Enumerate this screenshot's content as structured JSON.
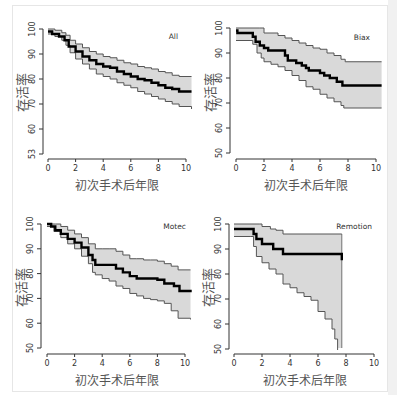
{
  "chart_data": [
    {
      "type": "line",
      "title": "All",
      "xlabel": "初次手术后年限",
      "ylabel": "存活率",
      "xlim": [
        0,
        10
      ],
      "ylim": [
        50,
        100
      ],
      "xticks": [
        0,
        2,
        4,
        6,
        8,
        10
      ],
      "yticks": [
        50,
        60,
        70,
        80,
        90,
        100
      ],
      "ytick_labels": [
        "53",
        "60",
        "70",
        "80",
        "90",
        "100"
      ],
      "grid": false,
      "series": [
        {
          "name": "survival",
          "x": [
            0,
            0.3,
            0.8,
            1.2,
            1.5,
            2,
            2.5,
            3,
            3.5,
            4,
            4.5,
            5,
            5.5,
            6,
            6.5,
            7,
            7.5,
            8,
            8.5,
            9,
            9.5,
            10.4
          ],
          "y": [
            99,
            98,
            97,
            95.5,
            93,
            91,
            89,
            87.5,
            86,
            85,
            84.5,
            83,
            82,
            81,
            80,
            79.5,
            78.5,
            77.5,
            76.5,
            76,
            75,
            75
          ]
        },
        {
          "name": "upper_ci",
          "x": [
            0,
            0.5,
            1,
            1.3,
            1.6,
            2,
            2.5,
            3,
            3.5,
            4,
            4.5,
            5,
            5.5,
            6,
            6.5,
            7,
            7.5,
            8,
            8.5,
            9,
            9.5,
            10.4
          ],
          "y": [
            100,
            99.5,
            98.5,
            97.5,
            95.5,
            94,
            92.5,
            91,
            90,
            89,
            88.5,
            87.5,
            86.5,
            86,
            85,
            84.5,
            84,
            83,
            82.5,
            81.5,
            81,
            81
          ]
        },
        {
          "name": "lower_ci",
          "x": [
            0,
            0.5,
            1,
            1.3,
            1.6,
            2,
            2.5,
            3,
            3.5,
            4,
            4.5,
            5,
            5.5,
            6,
            6.5,
            7,
            7.5,
            8,
            8.5,
            9,
            9.5,
            10.4
          ],
          "y": [
            98,
            97,
            95.5,
            93.5,
            90.5,
            88,
            86,
            84,
            82,
            81,
            80,
            78.5,
            77.5,
            76.5,
            75,
            74,
            73,
            72,
            71,
            70,
            69,
            68
          ]
        }
      ]
    },
    {
      "type": "line",
      "title": "Biax",
      "xlabel": "初次手术后年限",
      "ylabel": "存活率",
      "xlim": [
        0,
        10
      ],
      "ylim": [
        50,
        100
      ],
      "xticks": [
        0,
        2,
        4,
        6,
        8,
        10
      ],
      "yticks": [
        50,
        60,
        70,
        80,
        90,
        100
      ],
      "ytick_labels": [
        "50",
        "60",
        "70",
        "80",
        "90",
        "100"
      ],
      "grid": false,
      "series": [
        {
          "name": "survival",
          "x": [
            0,
            0.1,
            1.2,
            1.4,
            1.7,
            2,
            2.3,
            3.5,
            3.7,
            4.3,
            4.7,
            5,
            5.2,
            6,
            6.3,
            6.7,
            7.2,
            7.6,
            10.4
          ],
          "y": [
            99,
            98,
            96.5,
            94.5,
            93,
            92,
            91,
            89,
            87,
            86,
            85,
            84,
            83,
            82,
            81,
            80,
            78.5,
            77,
            77
          ]
        },
        {
          "name": "upper_ci",
          "x": [
            0,
            1.7,
            2,
            3,
            3.5,
            4,
            4.5,
            5,
            5.5,
            6,
            6.5,
            7,
            7.5,
            7.8,
            10.4
          ],
          "y": [
            100,
            100,
            98,
            97,
            96,
            95,
            94,
            93,
            92,
            91.5,
            90,
            89,
            87.5,
            86.5,
            86.5
          ]
        },
        {
          "name": "lower_ci",
          "x": [
            0,
            1,
            1.2,
            1.5,
            1.8,
            2,
            2.5,
            3,
            3.5,
            4,
            4.5,
            5,
            5.5,
            6,
            6.5,
            7,
            7.5,
            7.7,
            10.4
          ],
          "y": [
            95,
            95,
            93.5,
            90,
            88,
            86.5,
            85.5,
            84.5,
            83,
            81,
            79,
            76.5,
            75.5,
            73.5,
            72,
            70.5,
            69,
            68,
            68
          ]
        }
      ]
    },
    {
      "type": "line",
      "title": "Motec",
      "xlabel": "初次手术后年限",
      "ylabel": "存活率",
      "xlim": [
        0,
        10
      ],
      "ylim": [
        50,
        100
      ],
      "xticks": [
        0,
        2,
        4,
        6,
        8,
        10
      ],
      "yticks": [
        50,
        60,
        70,
        80,
        90,
        100
      ],
      "ytick_labels": [
        "50",
        "60",
        "70",
        "80",
        "90",
        "100"
      ],
      "grid": false,
      "series": [
        {
          "name": "survival",
          "x": [
            0,
            0.3,
            0.6,
            1,
            1.5,
            2,
            2.5,
            3,
            3.3,
            3.5,
            4.5,
            5,
            5.5,
            6,
            6.5,
            7,
            7.5,
            8,
            8.5,
            9.2,
            9.6,
            10.4
          ],
          "y": [
            100,
            99,
            97.5,
            96,
            94,
            92.5,
            90.5,
            87.5,
            85.5,
            83.5,
            83.5,
            82,
            80.5,
            79,
            78,
            78,
            78,
            77.5,
            76,
            75,
            73,
            72.5
          ]
        },
        {
          "name": "upper_ci",
          "x": [
            0,
            0.6,
            1,
            1.5,
            2,
            2.5,
            3,
            3.5,
            4,
            4.5,
            5,
            5.5,
            6,
            6.5,
            7,
            7.5,
            8,
            8.5,
            9,
            9.5,
            10.4
          ],
          "y": [
            100,
            100,
            99,
            97.5,
            96,
            94.5,
            92,
            90,
            90,
            90,
            89,
            87.5,
            86,
            86,
            85.5,
            85.5,
            85,
            84,
            83,
            81.5,
            81.5
          ]
        },
        {
          "name": "lower_ci",
          "x": [
            0,
            0.5,
            1,
            1.5,
            2,
            2.5,
            3,
            3.3,
            3.5,
            4,
            4.5,
            5,
            5.5,
            6,
            6.5,
            7,
            7.5,
            8,
            8.5,
            9,
            9.5,
            10.4
          ],
          "y": [
            99,
            97,
            94.5,
            92,
            90,
            87,
            84,
            80.5,
            79.5,
            78,
            77,
            75,
            74,
            72,
            71,
            70,
            69.5,
            69,
            68,
            65,
            62,
            61.5
          ]
        }
      ]
    },
    {
      "type": "line",
      "title": "Remotion",
      "xlabel": "初次手术后年限",
      "ylabel": "存活率",
      "xlim": [
        0,
        10
      ],
      "ylim": [
        50,
        100
      ],
      "xticks": [
        0,
        2,
        4,
        6,
        8,
        10
      ],
      "yticks": [
        50,
        60,
        70,
        80,
        90,
        100
      ],
      "ytick_labels": [
        "50",
        "60",
        "70",
        "80",
        "90",
        "100"
      ],
      "grid": false,
      "series": [
        {
          "name": "survival",
          "x": [
            0,
            1.2,
            1.4,
            1.6,
            2,
            2.8,
            3.5,
            7.7
          ],
          "y": [
            98,
            98,
            96,
            94,
            92,
            90,
            88,
            85.5
          ]
        },
        {
          "name": "upper_ci",
          "x": [
            0,
            1.8,
            2,
            2.6,
            3,
            3.5,
            7.7
          ],
          "y": [
            100,
            100,
            99,
            98,
            97.5,
            96,
            96
          ]
        },
        {
          "name": "lower_ci",
          "x": [
            0,
            1.2,
            1.4,
            1.6,
            2,
            2.5,
            3,
            3.5,
            4,
            4.5,
            5,
            5.5,
            6,
            6.5,
            7,
            7.2,
            7.4
          ],
          "y": [
            95,
            95,
            91,
            87,
            84.5,
            82,
            80,
            76,
            74.5,
            72.5,
            71,
            69.5,
            65,
            62,
            58,
            54,
            48
          ]
        }
      ]
    }
  ],
  "panels": [
    {
      "title": "All",
      "xlabel": "初次手术后年限",
      "ylabel": "存活率"
    },
    {
      "title": "Biax",
      "xlabel": "初次手术后年限",
      "ylabel": "存活率"
    },
    {
      "title": "Motec",
      "xlabel": "初次手术后年限",
      "ylabel": "存活率"
    },
    {
      "title": "Remotion",
      "xlabel": "初次手术后年限",
      "ylabel": "存活率"
    }
  ],
  "colors": {
    "survival_line": "#000000",
    "ci_line": "#555555",
    "ci_fill": "#d9d9d9",
    "axis": "#333333"
  }
}
